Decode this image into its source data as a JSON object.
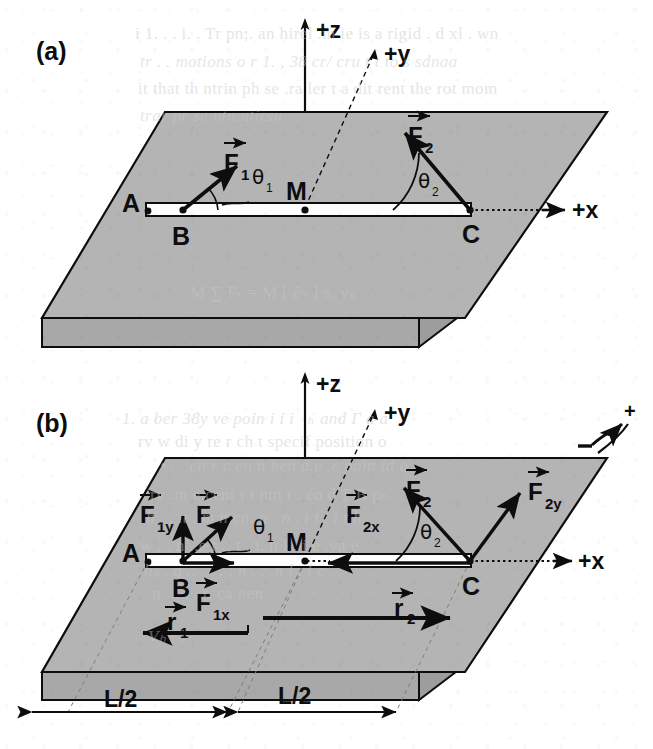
{
  "figure": {
    "colors": {
      "slab_top": "#b4b4b4",
      "slab_side": "#a8a8a8",
      "ink": "#0d0d0d",
      "rod_fill": "#fdfdfd",
      "paper": "#ffffff",
      "ghost_text": "#c9c9c9"
    },
    "panels": [
      {
        "id": "a",
        "label": "(a)",
        "axes": [
          {
            "name": "z-axis",
            "label": "+z",
            "direction": "up"
          },
          {
            "name": "y-axis",
            "label": "+y",
            "direction": "up-right-diagonal"
          },
          {
            "name": "x-axis",
            "label": "+x",
            "direction": "right"
          }
        ],
        "points": [
          {
            "name": "point-A",
            "label": "A"
          },
          {
            "name": "point-B",
            "label": "B"
          },
          {
            "name": "point-M",
            "label": "M"
          },
          {
            "name": "point-C",
            "label": "C"
          }
        ],
        "vectors": [
          {
            "name": "force-F1",
            "label": "F",
            "sub": "1",
            "applied_at": "B",
            "direction": "up-right"
          },
          {
            "name": "force-F2",
            "label": "F",
            "sub": "2",
            "applied_at": "C",
            "direction": "up-left"
          }
        ],
        "angles": [
          {
            "name": "angle-theta1",
            "label": "θ",
            "sub": "1",
            "at": "B"
          },
          {
            "name": "angle-theta2",
            "label": "θ",
            "sub": "2",
            "at": "C"
          }
        ]
      },
      {
        "id": "b",
        "label": "(b)",
        "axes": [
          {
            "name": "z-axis",
            "label": "+z",
            "direction": "up"
          },
          {
            "name": "y-axis",
            "label": "+y",
            "direction": "up-right-diagonal"
          },
          {
            "name": "x-axis",
            "label": "+x",
            "direction": "right"
          }
        ],
        "points": [
          {
            "name": "point-A",
            "label": "A"
          },
          {
            "name": "point-B",
            "label": "B"
          },
          {
            "name": "point-M",
            "label": "M"
          },
          {
            "name": "point-C",
            "label": "C"
          }
        ],
        "vectors": [
          {
            "name": "force-F1",
            "label": "F",
            "sub": "1",
            "applied_at": "B",
            "direction": "up-right"
          },
          {
            "name": "force-F1y",
            "label": "F",
            "sub": "1y",
            "applied_at": "B",
            "direction": "up"
          },
          {
            "name": "force-F1x",
            "label": "F",
            "sub": "1x",
            "applied_at": "B",
            "direction": "right"
          },
          {
            "name": "force-F2",
            "label": "F",
            "sub": "2",
            "applied_at": "C",
            "direction": "up-left"
          },
          {
            "name": "force-F2y",
            "label": "F",
            "sub": "2y",
            "applied_at": "C",
            "direction": "up-right"
          },
          {
            "name": "force-F2x",
            "label": "F",
            "sub": "2x",
            "applied_at": "C",
            "direction": "left"
          },
          {
            "name": "position-r1",
            "label": "r",
            "sub": "1",
            "direction": "left"
          },
          {
            "name": "position-r2",
            "label": "r",
            "sub": "2",
            "direction": "right"
          }
        ],
        "angles": [
          {
            "name": "angle-theta1",
            "label": "θ",
            "sub": "1",
            "at": "B"
          },
          {
            "name": "angle-theta2",
            "label": "θ",
            "sub": "2",
            "at": "C"
          }
        ],
        "dimensions": [
          {
            "name": "dimension-left",
            "label": "L/2"
          },
          {
            "name": "dimension-right",
            "label": "L/2"
          }
        ],
        "rotation_sign": {
          "name": "rotation-convention",
          "positive_label": "+",
          "negative_label": "−"
        }
      }
    ]
  },
  "background_text": {
    "lines": [
      {
        "text": "i  1. . . i.  . Tr pn;. an hirel .m ie  is a rigid  . d  xl . wn",
        "x": 135,
        "y": 24
      },
      {
        "text": "tr   . .  motions  o  r 1. , 38 cr/ cru  t  t to  s  sdnaa",
        "x": 140,
        "y": 52
      },
      {
        "text": "it  that th   ntrin ph se  .ra   ler  t  a dit rent  the rot   mom",
        "x": 138,
        "y": 79
      },
      {
        "text": "trar   pr se ntn.ntirsu",
        "x": 140,
        "y": 106
      },
      {
        "text": "M ∑ Fₜ = M [ ēₕ ] sₐ vₛ",
        "x": 190,
        "y": 282
      },
      {
        "text": "1. a  ber  38y  ve  poin   i   i  i⃗ₕ and   Γ a  a",
        "x": 122,
        "y": 408
      },
      {
        "text": "rv  w  di    y  re   r  ch  t  specif  position  o",
        "x": 138,
        "y": 432
      },
      {
        "text": "•  . . en    r c  en  n  hen a.e   .e    poin   id  o",
        "x": 160,
        "y": 456
      },
      {
        "text": "rv  .m e.cent  t  t   ntn  t  .    éo  d   T  Β  pₕ",
        "x": 150,
        "y": 484
      },
      {
        "text": "h  . .  .t  .  m  n cn.  n  .  n   .  ı  t   . i  t  h",
        "x": 146,
        "y": 508
      },
      {
        "text": "w   ,  . n   ..e   r  .,  t  .  i.    n l     .   i  e  .va e",
        "x": 140,
        "y": 536
      },
      {
        "text": "hₛ  . g  ..    . . .   . n  .  .    .n l     . l  e ᵧ",
        "x": 144,
        "y": 560
      },
      {
        "text": "n   . . . .  r. ca   nen",
        "x": 152,
        "y": 584
      },
      {
        "text": "Vₕ  ·  .",
        "x": 148,
        "y": 626
      }
    ]
  }
}
